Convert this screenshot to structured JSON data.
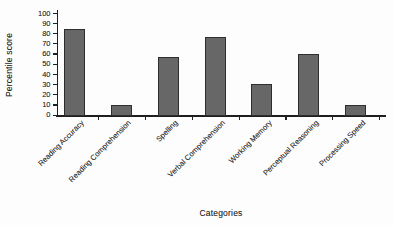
{
  "chart_data": {
    "type": "bar",
    "title": "",
    "xlabel": "Categories",
    "ylabel": "Percentile score",
    "categories": [
      "Reading Accuracy",
      "Reading Comprehension",
      "Spelling",
      "Verbal Comprehension",
      "Working Memory",
      "Perceptual Reasoning",
      "Processing Speed"
    ],
    "values": [
      85,
      10,
      57,
      77,
      30,
      60,
      10
    ],
    "ylim": [
      0,
      100
    ],
    "ytick_step": 10,
    "grid": false,
    "legend": false,
    "bar_color": "#676767",
    "bar_border_color": "#2e2e2e",
    "axis_color": "#1f1f1f",
    "text_color": "#2b2b2b"
  }
}
